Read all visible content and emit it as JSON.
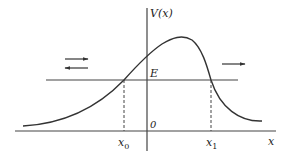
{
  "diagram": {
    "type": "potential-barrier",
    "y_axis_label": "V(x)",
    "x_axis_label": "x",
    "energy_label": "E",
    "origin_label": "0",
    "turning_points": [
      {
        "label": "x",
        "subscript": "0"
      },
      {
        "label": "x",
        "subscript": "1"
      }
    ],
    "arrows": [
      {
        "direction": "right",
        "side": "left"
      },
      {
        "direction": "left",
        "side": "left"
      },
      {
        "direction": "right",
        "side": "right"
      }
    ],
    "colors": {
      "line": "#333333",
      "background": "#ffffff"
    }
  }
}
